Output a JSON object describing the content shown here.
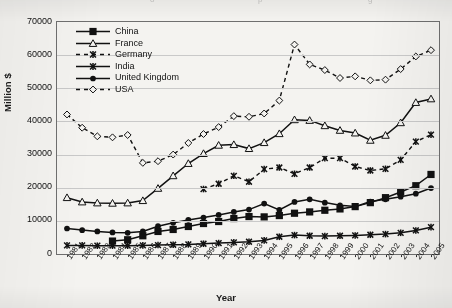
{
  "scan_artifact": [
    "o",
    "p",
    "g"
  ],
  "axes": {
    "ylabel": "Million $",
    "xlabel": "Year",
    "yticks": [
      "70000",
      "60000",
      "50000",
      "40000",
      "30000",
      "20000",
      "10000",
      "0"
    ],
    "xticks": [
      "1981",
      "1982",
      "1983",
      "1984",
      "1985",
      "1986",
      "1987",
      "1988",
      "1989",
      "1990",
      "1991",
      "1992",
      "1993",
      "1994",
      "1995",
      "1996",
      "1997",
      "1998",
      "1999",
      "2000",
      "2001",
      "2002",
      "2003",
      "2004",
      "2005"
    ]
  },
  "legend": {
    "entries": [
      {
        "label": "China",
        "marker": "filled-square",
        "line": "solid",
        "color": "#111111"
      },
      {
        "label": "France",
        "marker": "open-triangle",
        "line": "solid",
        "color": "#111111"
      },
      {
        "label": "Germany",
        "marker": "star-x",
        "line": "dashed",
        "color": "#111111"
      },
      {
        "label": "India",
        "marker": "star-x",
        "line": "solid",
        "color": "#111111"
      },
      {
        "label": "United Kingdom",
        "marker": "filled-circle",
        "line": "solid",
        "color": "#111111"
      },
      {
        "label": "USA",
        "marker": "open-diamond",
        "line": "dashed",
        "color": "#111111"
      }
    ]
  },
  "chart_data": {
    "type": "line",
    "title": "",
    "xlabel": "Year",
    "ylabel": "Million $",
    "ylim": [
      0,
      70000
    ],
    "ytick_step": 10000,
    "grid": "horizontal",
    "legend_position": "inside-top-left",
    "x": [
      1981,
      1982,
      1983,
      1984,
      1985,
      1986,
      1987,
      1988,
      1989,
      1990,
      1991,
      1992,
      1993,
      1994,
      1995,
      1996,
      1997,
      1998,
      1999,
      2000,
      2001,
      2002,
      2003,
      2004,
      2005
    ],
    "series": [
      {
        "name": "China",
        "marker": "filled-square",
        "line": "solid",
        "values": [
          null,
          null,
          null,
          3900,
          4300,
          5500,
          6800,
          7400,
          8300,
          9200,
          9800,
          10700,
          11300,
          11200,
          11600,
          12300,
          12700,
          13200,
          13600,
          14300,
          15500,
          17000,
          18700,
          20600,
          24000
        ]
      },
      {
        "name": "France",
        "marker": "open-triangle",
        "line": "solid",
        "values": [
          17000,
          15700,
          15400,
          15300,
          15400,
          16100,
          19800,
          23600,
          27300,
          30300,
          32800,
          33000,
          31800,
          33600,
          36300,
          40500,
          40300,
          38700,
          37300,
          36500,
          34300,
          35800,
          39600,
          45700,
          46800
        ]
      },
      {
        "name": "Germany",
        "marker": "star-x",
        "line": "dashed",
        "values": [
          null,
          null,
          null,
          null,
          null,
          null,
          null,
          null,
          null,
          19600,
          21200,
          23600,
          21800,
          25600,
          26100,
          24200,
          26100,
          28900,
          28900,
          26400,
          25200,
          25700,
          28400,
          33900,
          36000
        ]
      },
      {
        "name": "India",
        "marker": "star-x",
        "line": "solid",
        "values": [
          2600,
          2600,
          2500,
          2500,
          2500,
          2600,
          2700,
          2800,
          2900,
          3100,
          3300,
          3500,
          3700,
          4100,
          5200,
          5700,
          5500,
          5400,
          5500,
          5600,
          5800,
          6000,
          6400,
          7100,
          8100
        ]
      },
      {
        "name": "United Kingdom",
        "marker": "filled-circle",
        "line": "solid",
        "values": [
          7700,
          7200,
          6800,
          6500,
          6400,
          6800,
          8400,
          9400,
          10300,
          11000,
          11800,
          12700,
          13400,
          15200,
          13300,
          15700,
          16500,
          15500,
          14700,
          14300,
          15800,
          16500,
          17300,
          18200,
          19900
        ]
      },
      {
        "name": "USA",
        "marker": "open-diamond",
        "line": "dashed",
        "values": [
          42100,
          38100,
          35500,
          35200,
          35900,
          27500,
          28000,
          30000,
          33500,
          36200,
          38300,
          41600,
          41400,
          42400,
          46300,
          63200,
          57200,
          55500,
          53100,
          53600,
          52400,
          52600,
          55800,
          59600,
          61500
        ]
      }
    ]
  }
}
